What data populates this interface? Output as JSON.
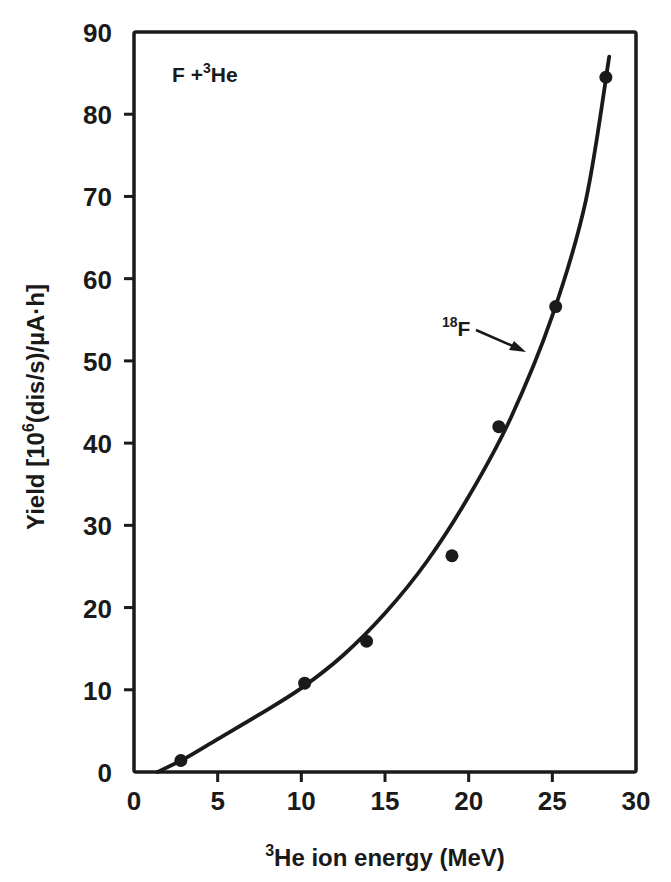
{
  "chart_data": {
    "type": "scatter",
    "title": "",
    "xlabel": "³He ion energy (MeV)",
    "xlabel_parts": {
      "sup": "3",
      "text": "He ion energy (MeV)"
    },
    "ylabel": "Yield [10⁶(dis/s)/µA·h]",
    "ylabel_parts": {
      "pre": "Yield [10",
      "sup": "6",
      "post": "(dis/s)/µA·h]"
    },
    "xlim": [
      0,
      30
    ],
    "ylim": [
      0,
      90
    ],
    "xticks": [
      0,
      5,
      10,
      15,
      20,
      25,
      30
    ],
    "yticks": [
      0,
      10,
      20,
      30,
      40,
      50,
      60,
      70,
      80,
      90
    ],
    "grid": false,
    "legend": null,
    "annotations": [
      {
        "text": "F + ³He",
        "parts": {
          "pre": "F +",
          "sup": "3",
          "post": "He"
        },
        "x": 1.3,
        "y": 84
      },
      {
        "text": "¹⁸F",
        "parts": {
          "sup": "18",
          "post": "F"
        },
        "x": 16.4,
        "y": 53,
        "arrow_to": [
          23.3,
          50.4
        ]
      }
    ],
    "series": [
      {
        "name": "18F measured yield",
        "kind": "scatter",
        "x": [
          2.8,
          10.2,
          13.9,
          19.0,
          21.8,
          25.2,
          28.2
        ],
        "y": [
          1.4,
          10.8,
          15.9,
          26.3,
          42.0,
          56.6,
          84.5
        ]
      },
      {
        "name": "18F fitted curve",
        "kind": "line",
        "x": [
          1.4,
          3,
          5,
          7.5,
          10,
          12.5,
          15,
          17.5,
          20,
          22.5,
          25,
          27,
          28.4
        ],
        "y": [
          0,
          1.6,
          4.0,
          7.0,
          10.2,
          14.2,
          19.3,
          25.6,
          33.5,
          43.0,
          55.5,
          69.5,
          87.0
        ]
      }
    ]
  },
  "labels": {
    "x_ticks": [
      "0",
      "5",
      "10",
      "15",
      "20",
      "25",
      "30"
    ],
    "y_ticks": [
      "0",
      "10",
      "20",
      "30",
      "40",
      "50",
      "60",
      "70",
      "80",
      "90"
    ],
    "x_title_sup": "3",
    "x_title_text": "He ion energy (MeV)",
    "y_title_pre": "Yield [10",
    "y_title_sup": "6",
    "y_title_post": "(dis/s)/µA·h]",
    "reaction_pre": "F +",
    "reaction_sup": "3",
    "reaction_post": "He",
    "isotope_sup": "18",
    "isotope_post": "F"
  },
  "colors": {
    "ink": "#1a1a1a",
    "background": "#ffffff"
  }
}
